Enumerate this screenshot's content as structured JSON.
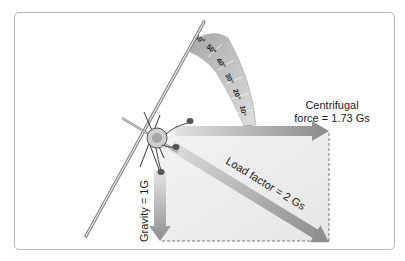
{
  "figure": {
    "colors": {
      "frame": "#b9b9b9",
      "arrow_dark": "#8a8a8a",
      "arrow_light": "#d8d8d8",
      "rect_fill": "#eeeeee",
      "dash": "#777777",
      "text": "#1a1a1a"
    }
  },
  "bank_scale": {
    "ticks": [
      "60°",
      "50°",
      "40°",
      "30°",
      "20°",
      "10°"
    ]
  },
  "forces": {
    "centrifugal": {
      "line1": "Centrifugal",
      "line2": "force = 1.73 Gs"
    },
    "gravity": {
      "label": "Gravity = 1G"
    },
    "load_factor": {
      "label": "Load factor = 2 Gs"
    }
  }
}
